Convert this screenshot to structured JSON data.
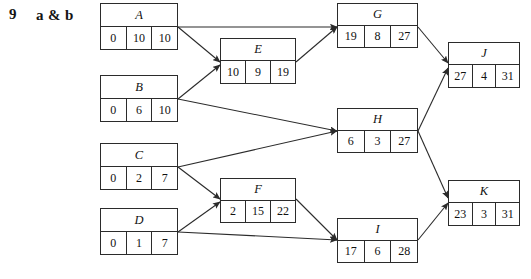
{
  "question": {
    "number": "9",
    "parts": "a & b"
  },
  "diagram": {
    "type": "activity-on-node-network",
    "canvas": {
      "width": 531,
      "height": 279
    },
    "nodes": [
      {
        "id": "A",
        "label": "A",
        "cells": [
          "0",
          "10",
          "10"
        ],
        "x": 100,
        "y": 3,
        "w": 78,
        "h": 47
      },
      {
        "id": "B",
        "label": "B",
        "cells": [
          "0",
          "6",
          "10"
        ],
        "x": 100,
        "y": 75,
        "w": 78,
        "h": 47
      },
      {
        "id": "C",
        "label": "C",
        "cells": [
          "0",
          "2",
          "7"
        ],
        "x": 100,
        "y": 143,
        "w": 78,
        "h": 47
      },
      {
        "id": "D",
        "label": "D",
        "cells": [
          "0",
          "1",
          "7"
        ],
        "x": 100,
        "y": 208,
        "w": 78,
        "h": 47
      },
      {
        "id": "E",
        "label": "E",
        "cells": [
          "10",
          "9",
          "19"
        ],
        "x": 220,
        "y": 38,
        "w": 76,
        "h": 46
      },
      {
        "id": "F",
        "label": "F",
        "cells": [
          "2",
          "15",
          "22"
        ],
        "x": 220,
        "y": 178,
        "w": 76,
        "h": 45
      },
      {
        "id": "G",
        "label": "G",
        "cells": [
          "19",
          "8",
          "27"
        ],
        "x": 337,
        "y": 3,
        "w": 81,
        "h": 45
      },
      {
        "id": "H",
        "label": "H",
        "cells": [
          "6",
          "3",
          "27"
        ],
        "x": 337,
        "y": 108,
        "w": 81,
        "h": 45
      },
      {
        "id": "I",
        "label": "I",
        "cells": [
          "17",
          "6",
          "28"
        ],
        "x": 337,
        "y": 218,
        "w": 81,
        "h": 45
      },
      {
        "id": "J",
        "label": "J",
        "cells": [
          "27",
          "4",
          "31"
        ],
        "x": 448,
        "y": 42,
        "w": 72,
        "h": 46
      },
      {
        "id": "K",
        "label": "K",
        "cells": [
          "23",
          "3",
          "31"
        ],
        "x": 448,
        "y": 180,
        "w": 72,
        "h": 46
      }
    ],
    "edges": [
      {
        "from": "A",
        "to": "G",
        "x1": 178,
        "y1": 27,
        "x2": 337,
        "y2": 27
      },
      {
        "from": "A",
        "to": "E",
        "x1": 178,
        "y1": 27,
        "x2": 220,
        "y2": 62
      },
      {
        "from": "B",
        "to": "E",
        "x1": 178,
        "y1": 99,
        "x2": 220,
        "y2": 65
      },
      {
        "from": "B",
        "to": "H",
        "x1": 178,
        "y1": 99,
        "x2": 337,
        "y2": 131
      },
      {
        "from": "C",
        "to": "H",
        "x1": 178,
        "y1": 167,
        "x2": 337,
        "y2": 131
      },
      {
        "from": "C",
        "to": "F",
        "x1": 178,
        "y1": 167,
        "x2": 220,
        "y2": 199
      },
      {
        "from": "D",
        "to": "F",
        "x1": 178,
        "y1": 232,
        "x2": 220,
        "y2": 202
      },
      {
        "from": "D",
        "to": "I",
        "x1": 178,
        "y1": 232,
        "x2": 337,
        "y2": 240
      },
      {
        "from": "E",
        "to": "G",
        "x1": 296,
        "y1": 62,
        "x2": 337,
        "y2": 27
      },
      {
        "from": "F",
        "to": "I",
        "x1": 296,
        "y1": 199,
        "x2": 337,
        "y2": 240
      },
      {
        "from": "G",
        "to": "J",
        "x1": 418,
        "y1": 27,
        "x2": 448,
        "y2": 63
      },
      {
        "from": "H",
        "to": "J",
        "x1": 418,
        "y1": 131,
        "x2": 448,
        "y2": 68
      },
      {
        "from": "H",
        "to": "K",
        "x1": 418,
        "y1": 131,
        "x2": 448,
        "y2": 198
      },
      {
        "from": "I",
        "to": "K",
        "x1": 418,
        "y1": 240,
        "x2": 448,
        "y2": 203
      }
    ],
    "colors": {
      "line": "#2b2b2b",
      "text": "#111111",
      "background": "#ffffff"
    }
  }
}
